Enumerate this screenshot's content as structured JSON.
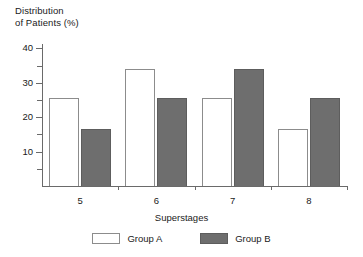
{
  "chart_data": {
    "type": "bar",
    "title": "",
    "ylabel": "Distribution\nof Patients (%)",
    "xlabel": "Superstages",
    "categories": [
      "5",
      "6",
      "7",
      "8"
    ],
    "series": [
      {
        "name": "Group A",
        "values": [
          25.5,
          34,
          25.5,
          16.5
        ],
        "color": "#ffffff",
        "edge_color": "#8c8c8c"
      },
      {
        "name": "Group B",
        "values": [
          16.5,
          25.5,
          34,
          25.5
        ],
        "color": "#6e6e6e",
        "edge_color": "#5d5d5d"
      }
    ],
    "ylim": [
      0,
      41
    ],
    "y_major_ticks": [
      10,
      20,
      30,
      40
    ],
    "y_minor_ticks": [
      5,
      15,
      25,
      35
    ],
    "y_tick_labels": [
      "10",
      "20",
      "30",
      "40"
    ],
    "grid": false,
    "legend_position": "bottom-center"
  },
  "axes": {
    "y_title": "Distribution\nof Patients (%)",
    "x_title": "Superstages",
    "y_labels": [
      "40",
      "30",
      "20",
      "10"
    ],
    "x_labels": [
      "5",
      "6",
      "7",
      "8"
    ]
  },
  "legend": {
    "entries": [
      {
        "label": "Group A"
      },
      {
        "label": "Group B"
      }
    ]
  }
}
